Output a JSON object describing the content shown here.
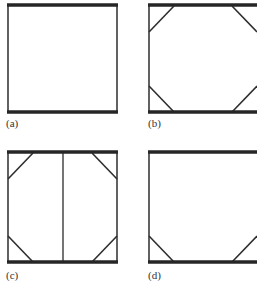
{
  "figure": {
    "colors": {
      "beam": "#262626",
      "post": "#3a3a3a",
      "brace": "#2e2e2e",
      "label": "#333333",
      "background": "#ffffff"
    },
    "panels": [
      {
        "id": "a",
        "label": "(a)",
        "label_pos": [
          6,
          118
        ],
        "frame": {
          "x0": 8,
          "x1": 117,
          "top": 5,
          "bottom": 112
        },
        "center_post": false,
        "braces": []
      },
      {
        "id": "b",
        "label": "(b)",
        "label_pos": [
          148,
          118
        ],
        "frame": {
          "x0": 149,
          "x1": 260,
          "top": 5,
          "bottom": 112
        },
        "center_post": false,
        "braces": [
          "top-left",
          "top-right",
          "bottom-left",
          "bottom-right"
        ]
      },
      {
        "id": "c",
        "label": "(c)",
        "label_pos": [
          6,
          270
        ],
        "frame": {
          "x0": 8,
          "x1": 117,
          "top": 152,
          "bottom": 262
        },
        "center_post": true,
        "braces": [
          "top-left",
          "top-right",
          "bottom-left",
          "bottom-right"
        ]
      },
      {
        "id": "d",
        "label": "(d)",
        "label_pos": [
          148,
          270
        ],
        "frame": {
          "x0": 149,
          "x1": 260,
          "top": 152,
          "bottom": 262
        },
        "center_post": false,
        "braces": [
          "bottom-left",
          "bottom-right"
        ]
      }
    ],
    "brace_size": 25
  }
}
